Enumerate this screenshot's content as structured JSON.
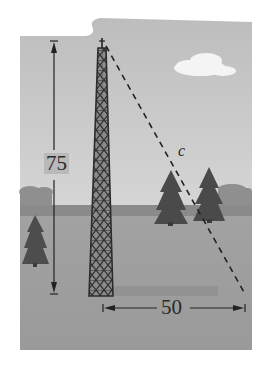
{
  "figure": {
    "labels": {
      "height": "75",
      "base": "50",
      "hypotenuse": "c"
    },
    "colors": {
      "page_background": "#ffffff",
      "sky": "#c3c3c3",
      "sky_light": "#d2d2d2",
      "ground": "#9d9d9d",
      "horizon_band": "#8a8a8a",
      "distant_trees": "#8f8f8f",
      "tree": "#4a4a4a",
      "tower": "#3c3c3c",
      "tower_shadow": "#8c8c8c",
      "cloud": "#f4f4f4",
      "line": "#222222"
    },
    "elements": {
      "tower": {
        "base_left_x": 89,
        "base_right_x": 113,
        "base_y": 295,
        "top_x": 102,
        "top_y": 42
      },
      "height_dimension": {
        "x": 54,
        "y_top": 41,
        "y_bottom": 294
      },
      "base_dimension": {
        "y": 308,
        "x_left": 103,
        "x_right": 245
      },
      "hypotenuse_line": {
        "x1": 106,
        "y1": 46,
        "x2": 245,
        "y2": 294,
        "style": "dashed"
      },
      "cloud": {
        "cx": 205,
        "cy": 66
      },
      "trees": [
        {
          "name": "tree-center-left",
          "x": 170,
          "y": 205,
          "height": 52
        },
        {
          "name": "tree-center-right",
          "x": 210,
          "y": 205,
          "height": 58
        },
        {
          "name": "tree-left",
          "x": 36,
          "y": 242,
          "height": 55
        }
      ]
    }
  }
}
